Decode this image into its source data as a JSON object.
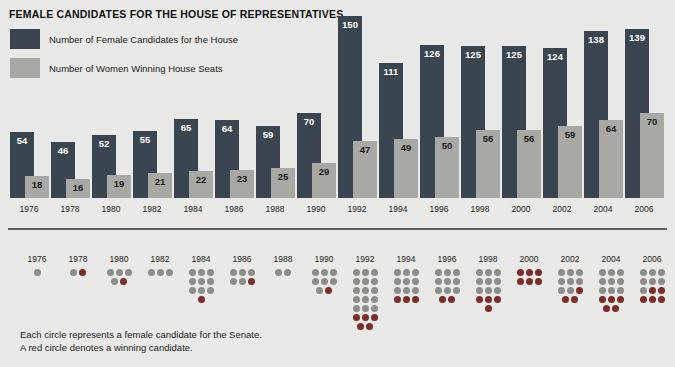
{
  "colors": {
    "background": "#e9e9e7",
    "bar_candidates": "#3a4550",
    "bar_winners": "#a8a9a5",
    "dot_candidate": "#8d8e8a",
    "dot_winner": "#7c2d2a",
    "rule": "#5e5e5e"
  },
  "house": {
    "title": "FEMALE CANDIDATES FOR THE HOUSE OF REPRESENTATIVES",
    "legend": [
      {
        "swatch": "dark",
        "label": "Number of Female Candidates for the House"
      },
      {
        "swatch": "light",
        "label": "Number of Women Winning House Seats"
      }
    ]
  },
  "senate": {
    "title": "FEMALE CANDIDATES FOR THE SENATE",
    "footnote_line1": "Each circle represents a female candidate for the Senate.",
    "footnote_line2": "A red circle denotes a winning candidate."
  },
  "chart_data": [
    {
      "type": "bar",
      "title": "FEMALE CANDIDATES FOR THE HOUSE OF REPRESENTATIVES",
      "xlabel": "",
      "ylabel": "",
      "ylim": [
        0,
        150
      ],
      "grid": false,
      "legend_position": "top-left",
      "categories": [
        "1976",
        "1978",
        "1980",
        "1982",
        "1984",
        "1986",
        "1988",
        "1990",
        "1992",
        "1994",
        "1996",
        "1998",
        "2000",
        "2002",
        "2004",
        "2006"
      ],
      "series": [
        {
          "name": "Number of Female Candidates for the House",
          "values": [
            54,
            46,
            52,
            55,
            65,
            64,
            59,
            70,
            150,
            111,
            126,
            125,
            125,
            124,
            138,
            139
          ]
        },
        {
          "name": "Number of Women Winning House Seats",
          "values": [
            18,
            16,
            19,
            21,
            22,
            23,
            25,
            29,
            47,
            49,
            50,
            56,
            56,
            59,
            64,
            70
          ]
        }
      ]
    },
    {
      "type": "pictogram",
      "title": "FEMALE CANDIDATES FOR THE SENATE",
      "unit": "Each circle represents a female candidate for the Senate.",
      "categories": [
        "1976",
        "1978",
        "1980",
        "1982",
        "1984",
        "1986",
        "1988",
        "1990",
        "1992",
        "1994",
        "1996",
        "1998",
        "2000",
        "2002",
        "2004",
        "2006"
      ],
      "series": [
        {
          "name": "Female candidates for the Senate",
          "values": [
            1,
            2,
            5,
            3,
            10,
            6,
            2,
            8,
            20,
            12,
            11,
            13,
            6,
            11,
            14,
            12
          ]
        },
        {
          "name": "Winning candidates (red circles)",
          "values": [
            0,
            1,
            1,
            0,
            1,
            1,
            0,
            1,
            5,
            3,
            2,
            4,
            6,
            3,
            5,
            5
          ]
        }
      ]
    }
  ]
}
